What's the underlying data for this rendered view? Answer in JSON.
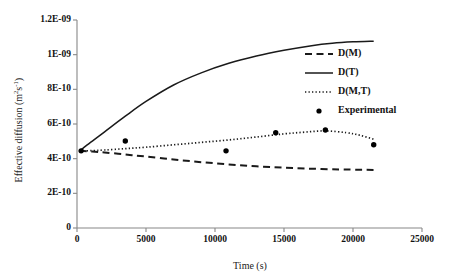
{
  "chart_data": {
    "type": "line",
    "title": "",
    "xlabel": "Time (s)",
    "ylabel": "Effective diffusion (m2s-1)",
    "ylabel_parts": {
      "base": "Effective diffusion (m",
      "sup1": "2",
      "mid": "s",
      "sup2": "-1",
      "tail": ")"
    },
    "xlim": [
      0,
      25000
    ],
    "ylim": [
      0,
      1.2e-09
    ],
    "grid": false,
    "legend_position": "inside-right",
    "xticks": [
      0,
      5000,
      10000,
      15000,
      20000,
      25000
    ],
    "xtick_labels": [
      "0",
      "5000",
      "10000",
      "15000",
      "20000",
      "25000"
    ],
    "yticks": [
      0,
      2e-10,
      4e-10,
      6e-10,
      8e-10,
      1e-09,
      1.2e-09
    ],
    "ytick_labels": [
      "0",
      "2E-10",
      "4E-10",
      "6E-10",
      "8E-10",
      "1E-09",
      "1.2E-09"
    ],
    "series": [
      {
        "name": "D(M)",
        "style": "dashed",
        "color": "#1a1a1a",
        "x": [
          200,
          1000,
          2000,
          3500,
          5000,
          7000,
          9000,
          11000,
          13000,
          15000,
          17000,
          19000,
          20500,
          21500
        ],
        "values": [
          4.45e-10,
          4.42e-10,
          4.36e-10,
          4.24e-10,
          4.12e-10,
          3.95e-10,
          3.8e-10,
          3.67e-10,
          3.56e-10,
          3.48e-10,
          3.42e-10,
          3.38e-10,
          3.36e-10,
          3.35e-10
        ]
      },
      {
        "name": "D(T)",
        "style": "solid",
        "color": "#1a1a1a",
        "x": [
          200,
          1000,
          2000,
          3500,
          5000,
          7000,
          9000,
          11000,
          13000,
          15000,
          17000,
          18500,
          20000,
          21500
        ],
        "values": [
          4.45e-10,
          4.95e-10,
          5.55e-10,
          6.45e-10,
          7.3e-10,
          8.25e-10,
          8.95e-10,
          9.5e-10,
          9.92e-10,
          1.025e-09,
          1.052e-09,
          1.066e-09,
          1.074e-09,
          1.078e-09
        ]
      },
      {
        "name": "D(M,T)",
        "style": "dotted",
        "color": "#1a1a1a",
        "x": [
          200,
          1000,
          2000,
          3500,
          5000,
          7000,
          9000,
          11000,
          13000,
          15000,
          16500,
          18000,
          19500,
          20500,
          21500
        ],
        "values": [
          4.45e-10,
          4.46e-10,
          4.5e-10,
          4.58e-10,
          4.66e-10,
          4.8e-10,
          4.94e-10,
          5.08e-10,
          5.25e-10,
          5.43e-10,
          5.53e-10,
          5.6e-10,
          5.5e-10,
          5.35e-10,
          5.12e-10
        ]
      },
      {
        "name": "Experimental",
        "style": "markers",
        "color": "#000000",
        "x": [
          300,
          3500,
          10800,
          14400,
          18000,
          21500
        ],
        "values": [
          4.45e-10,
          5.02e-10,
          4.45e-10,
          5.5e-10,
          5.65e-10,
          4.8e-10
        ]
      }
    ],
    "legend_entries": [
      {
        "label": "D(M)",
        "style": "dashed"
      },
      {
        "label": "D(T)",
        "style": "solid"
      },
      {
        "label": "D(M,T)",
        "style": "dotted"
      },
      {
        "label": "Experimental",
        "style": "markers"
      }
    ]
  }
}
